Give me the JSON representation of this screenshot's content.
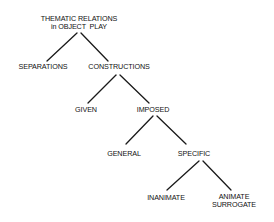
{
  "diagram": {
    "type": "tree",
    "nodes": {
      "root": {
        "line1": "THEMATIC RELATIONS",
        "line2": "in OBJECT  PLAY"
      },
      "separations": {
        "label": "SEPARATIONS"
      },
      "constructions": {
        "label": "CONSTRUCTIONS"
      },
      "given": {
        "label": "GIVEN"
      },
      "imposed": {
        "label": "IMPOSED"
      },
      "general": {
        "label": "GENERAL"
      },
      "specific": {
        "label": "SPECIFIC"
      },
      "inanimate": {
        "label": "INANIMATE"
      },
      "animate_surrogate": {
        "line1": "ANIMATE",
        "line2": "SURROGATE"
      }
    },
    "edges": [
      [
        "root",
        "separations"
      ],
      [
        "root",
        "constructions"
      ],
      [
        "constructions",
        "given"
      ],
      [
        "constructions",
        "imposed"
      ],
      [
        "imposed",
        "general"
      ],
      [
        "imposed",
        "specific"
      ],
      [
        "specific",
        "inanimate"
      ],
      [
        "specific",
        "animate_surrogate"
      ]
    ],
    "colors": {
      "line": "#1a1a1a",
      "text": "#111111",
      "background": "#ffffff"
    }
  }
}
